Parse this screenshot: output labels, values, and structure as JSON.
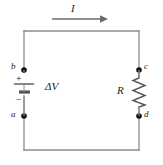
{
  "figure": {
    "type": "circuit-diagram",
    "background_color": "#ffffff",
    "wire_color": "#8c8c8c",
    "symbol_color": "#4d4d4d",
    "node_color": "#111111",
    "label_color": "#1a1a1a"
  },
  "labels": {
    "current": "I",
    "voltage": "ΔV",
    "resistance": "R",
    "battery_positive": "+",
    "battery_negative": "−",
    "node_a": "a",
    "node_b": "b",
    "node_c": "c",
    "node_d": "d"
  },
  "components": [
    {
      "name": "battery",
      "label": "ΔV",
      "side": "left"
    },
    {
      "name": "resistor",
      "label": "R",
      "side": "right"
    }
  ],
  "nodes": [
    {
      "id": "a",
      "position": "bottom-left"
    },
    {
      "id": "b",
      "position": "top-left"
    },
    {
      "id": "c",
      "position": "top-right"
    },
    {
      "id": "d",
      "position": "bottom-right"
    }
  ],
  "current_arrow": {
    "label": "I",
    "direction": "right",
    "location": "above-top-wire"
  }
}
